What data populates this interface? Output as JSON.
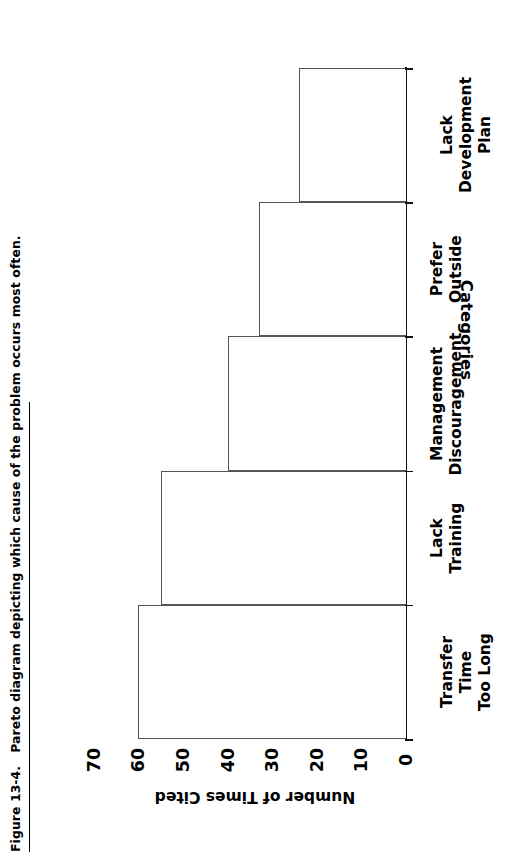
{
  "caption": {
    "number": "Figure 13-4.",
    "text": "Pareto diagram depicting which cause of the problem occurs most often."
  },
  "chart_data": {
    "type": "bar",
    "orientation": "vertical-rendered-rotated",
    "title": "",
    "xlabel": "Categories",
    "ylabel": "Number of Times Cited",
    "categories": [
      "Transfer\nTime\nToo Long",
      "Lack\nTraining",
      "Management\nDiscouragement",
      "Prefer\nOutside",
      "Lack\nDevelopment\nPlan"
    ],
    "category_lines": [
      [
        "Transfer",
        "Time",
        "Too Long"
      ],
      [
        "Lack",
        "Training"
      ],
      [
        "Management",
        "Discouragement"
      ],
      [
        "Prefer",
        "Outside"
      ],
      [
        "Lack",
        "Development",
        "Plan"
      ]
    ],
    "values": [
      60,
      55,
      40,
      33,
      24
    ],
    "ylim": [
      0,
      70
    ],
    "yticks": [
      70,
      60,
      50,
      40,
      30,
      20,
      10,
      0
    ],
    "ytick_labels": [
      "70",
      "60",
      "50",
      "40",
      "30",
      "20",
      "10",
      "0"
    ],
    "grid": false,
    "legend": null,
    "bar_fill": "#ffffff",
    "bar_stroke": "#555555",
    "axis_color": "#111111"
  }
}
